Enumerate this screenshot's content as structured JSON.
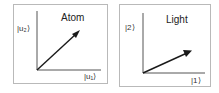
{
  "panels": [
    {
      "title": "Atom",
      "y_axis_label": "|u₂⟩",
      "x_axis_label": "|u₁⟩",
      "vector": {
        "angle_deg": 45,
        "description": "state vector at ~45 degrees"
      }
    },
    {
      "title": "Light",
      "y_axis_label": "|2⟩",
      "x_axis_label": "|1⟩",
      "vector": {
        "angle_deg": 22,
        "description": "state vector at ~22 degrees"
      }
    }
  ],
  "colors": {
    "border": "#b9b9b9",
    "axis": "#555555",
    "arrow": "#1a1a1a"
  }
}
